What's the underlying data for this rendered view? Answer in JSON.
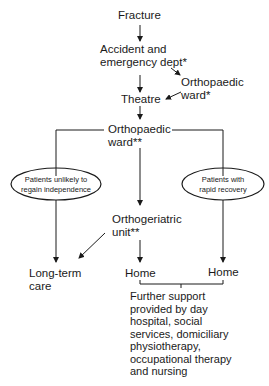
{
  "diagram": {
    "type": "flowchart",
    "nodes": {
      "fracture": "Fracture",
      "ae_line1": "Accident and",
      "ae_line2": "emergency dept*",
      "ortho_ward1_line1": "Orthopaedic",
      "ortho_ward1_line2": "ward*",
      "theatre": "Theatre",
      "ortho_ward2_line1": "Orthopaedic",
      "ortho_ward2_line2": "ward**",
      "unlikely_line1": "Patients unlikely to",
      "unlikely_line2": "regain independence",
      "rapid_line1": "Patients with",
      "rapid_line2": "rapid recovery",
      "orthoger_line1": "Orthogeriatric",
      "orthoger_line2": "unit**",
      "longterm_line1": "Long-term",
      "longterm_line2": "care",
      "home_center": "Home",
      "home_right": "Home"
    },
    "support_text": [
      "Further support",
      "provided by day",
      "hospital, social",
      "services, domiciliary",
      "physiotherapy,",
      "occupational therapy",
      "and nursing"
    ],
    "edges": [
      [
        "Fracture",
        "Accident and emergency dept*"
      ],
      [
        "Accident and emergency dept*",
        "Theatre"
      ],
      [
        "Accident and emergency dept*",
        "Orthopaedic ward*"
      ],
      [
        "Orthopaedic ward*",
        "Theatre"
      ],
      [
        "Theatre",
        "Orthopaedic ward**"
      ],
      [
        "Orthopaedic ward**",
        "Patients unlikely to regain independence"
      ],
      [
        "Orthopaedic ward**",
        "Patients with rapid recovery"
      ],
      [
        "Orthopaedic ward**",
        "Orthogeriatric unit**"
      ],
      [
        "Patients unlikely to regain independence",
        "Long-term care"
      ],
      [
        "Orthogeriatric unit**",
        "Long-term care"
      ],
      [
        "Orthogeriatric unit**",
        "Home"
      ],
      [
        "Patients with rapid recovery",
        "Home"
      ]
    ],
    "colors": {
      "line": "#1a1a1a",
      "background": "#ffffff"
    }
  }
}
